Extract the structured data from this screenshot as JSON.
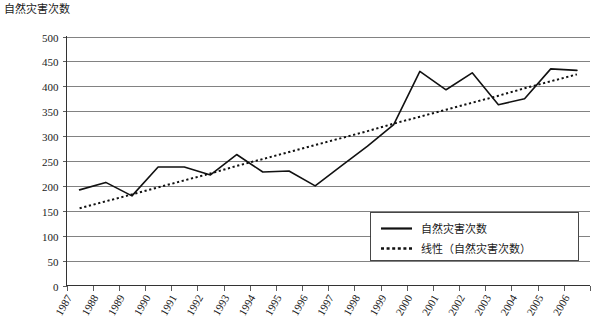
{
  "chart_data": {
    "type": "line",
    "title": "自然灾害次数",
    "xlabel": "",
    "ylabel": "",
    "ylim": [
      0,
      500
    ],
    "ytick_step": 50,
    "yticks": [
      "0",
      "50",
      "100",
      "150",
      "200",
      "250",
      "300",
      "350",
      "400",
      "450",
      "500"
    ],
    "grid": true,
    "legend_position": "inside-bottom-right",
    "categories": [
      "1987",
      "1988",
      "1989",
      "1990",
      "1991",
      "1992",
      "1993",
      "1994",
      "1995",
      "1996",
      "1997",
      "1998",
      "1999",
      "2000",
      "2001",
      "2002",
      "2003",
      "2004",
      "2005",
      "2006"
    ],
    "series": [
      {
        "name": "自然灾害次数",
        "style": "solid",
        "values": [
          192,
          207,
          180,
          238,
          238,
          222,
          263,
          228,
          230,
          200,
          240,
          280,
          323,
          430,
          393,
          427,
          363,
          375,
          435,
          432
        ]
      },
      {
        "name": "线性（自然灾害次数）",
        "style": "dotted",
        "values": [
          155,
          169,
          183,
          197,
          211,
          225,
          240,
          254,
          268,
          282,
          296,
          310,
          325,
          339,
          353,
          367,
          381,
          396,
          410,
          424
        ]
      }
    ]
  },
  "legend": {
    "items": [
      {
        "label": "自然灾害次数",
        "marker": "solid-line"
      },
      {
        "label": "线性（自然灾害次数）",
        "marker": "dotted-line"
      }
    ]
  },
  "colors": {
    "series_line": "#111111",
    "trend_line": "#111111",
    "grid": "#4d4d4d",
    "axis": "#333333",
    "background": "#ffffff",
    "text": "#1a1a1a"
  }
}
